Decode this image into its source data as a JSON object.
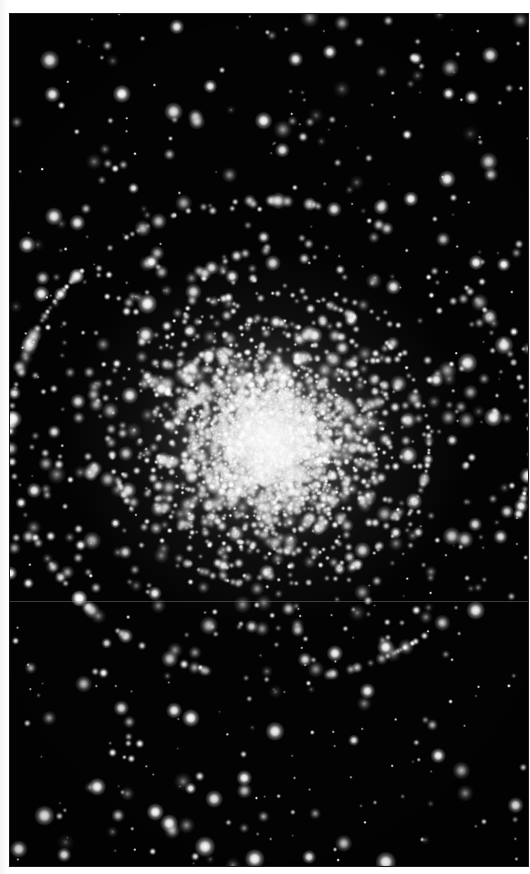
{
  "page": {
    "width": 530,
    "height": 874,
    "background_color": "#ffffff",
    "margin_color": "#f4f4f4"
  },
  "plate": {
    "label": "globular-cluster-photographic-plate",
    "x": 10,
    "y": 14,
    "width": 518,
    "height": 852,
    "sky_background_color": "#030303",
    "star_color": "#ffffff",
    "artifact": {
      "type": "horizontal-scan-line",
      "y": 601,
      "color": "#969696"
    }
  },
  "caption": {
    "text": ""
  },
  "chart_data": {
    "type": "scatter",
    "title": "",
    "subtitle": "",
    "xlabel": "",
    "ylabel": "",
    "grid": false,
    "legend": null,
    "background": "#030303",
    "point_color": "#ffffff",
    "axis_units": "image pixels",
    "xlim": [
      0,
      518
    ],
    "ylim": [
      0,
      852
    ],
    "cluster": {
      "center_x": 260,
      "center_y": 426,
      "core_radius_px": 60,
      "half_light_radius_px": 118,
      "halo_radius_px": 205,
      "tidal_extent_px": 260,
      "axis_ratio": 0.92,
      "position_angle_deg": 8,
      "profile": "king",
      "core_member_count": 2600,
      "halo_member_count": 1500,
      "total_member_count": 4100,
      "core_star_radius_px": [
        0.9,
        2.4
      ],
      "halo_star_radius_px": [
        1.3,
        3.4
      ]
    },
    "field": {
      "star_count": 520,
      "star_radius_px": [
        0.7,
        3.8
      ],
      "distribution": "uniform-random",
      "brightness_range": [
        0.35,
        1.0
      ]
    },
    "radial_profile": {
      "radius_px": [
        0,
        20,
        40,
        60,
        80,
        100,
        130,
        160,
        200,
        240,
        300
      ],
      "relative_surface_brightness": [
        1.0,
        0.94,
        0.81,
        0.62,
        0.44,
        0.31,
        0.19,
        0.11,
        0.05,
        0.02,
        0.004
      ]
    }
  }
}
